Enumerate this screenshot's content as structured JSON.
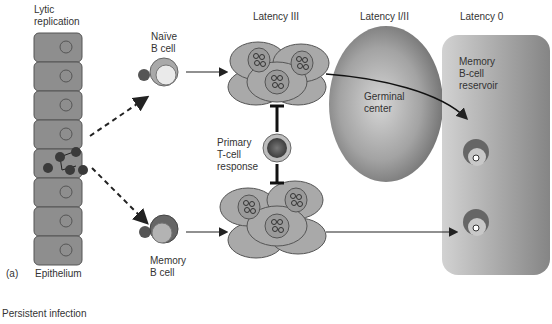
{
  "labels": {
    "lytic": [
      "Lytic",
      "replication"
    ],
    "naive": [
      "Naïve",
      "B cell"
    ],
    "latency3": "Latency III",
    "latency12": "Latency I/II",
    "latency0": "Latency 0",
    "germinal": [
      "Germinal",
      "center"
    ],
    "reservoir": [
      "Memory",
      "B-cell",
      "reservoir"
    ],
    "tcell": [
      "Primary",
      "T-cell",
      "response"
    ],
    "memory": [
      "Memory",
      "B cell"
    ],
    "panel": "(a)",
    "epithelium": "Epithelium",
    "caption": "Persistent infection"
  },
  "colors": {
    "cell_fill": "#8e8e8e",
    "cell_stroke": "#555555",
    "virus": "#3a3a3a",
    "blast_fill": "#a9a9a9",
    "gc_dark": "#6f6f6f",
    "gc_light": "#cfcfcf",
    "reservoir_light": "#c8c8c8",
    "reservoir_dark": "#8a8a8a"
  }
}
